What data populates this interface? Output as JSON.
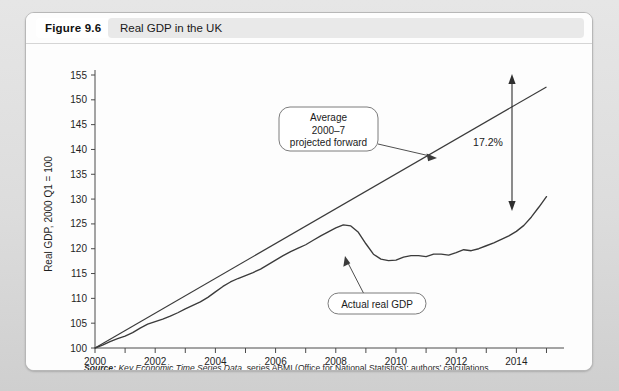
{
  "figure": {
    "number_label": "Figure 9.6",
    "title": "Real GDP in the UK",
    "source_lead": "Source:",
    "source_italic": " Key Economic Time Series Data,",
    "source_rest": " series ABMI (Office for National Statistics); authors’ calculations"
  },
  "annotations": {
    "trend_line1": "Average",
    "trend_line2": "2000–7",
    "trend_line3": "projected forward",
    "actual_label": "Actual real GDP",
    "gap_label": "17.2%"
  },
  "chart_data": {
    "type": "line",
    "title": "Real GDP in the UK",
    "xlabel": "",
    "ylabel": "Real GDP, 2000 Q1 = 100",
    "xlim": [
      2000,
      2015.25
    ],
    "ylim": [
      100,
      155
    ],
    "ytick_step": 5,
    "yticks": [
      100,
      105,
      110,
      115,
      120,
      125,
      130,
      135,
      140,
      145,
      150,
      155
    ],
    "xticks_major": [
      2000,
      2002,
      2004,
      2006,
      2008,
      2010,
      2012,
      2014
    ],
    "xticks_minor": [
      2001,
      2003,
      2005,
      2007,
      2009,
      2011,
      2013,
      2015
    ],
    "grid": false,
    "legend": "none",
    "series": [
      {
        "name": "Actual real GDP",
        "x": [
          2000.0,
          2000.25,
          2000.5,
          2000.75,
          2001.0,
          2001.25,
          2001.5,
          2001.75,
          2002.0,
          2002.25,
          2002.5,
          2002.75,
          2003.0,
          2003.25,
          2003.5,
          2003.75,
          2004.0,
          2004.25,
          2004.5,
          2004.75,
          2005.0,
          2005.25,
          2005.5,
          2005.75,
          2006.0,
          2006.25,
          2006.5,
          2006.75,
          2007.0,
          2007.25,
          2007.5,
          2007.75,
          2008.0,
          2008.25,
          2008.5,
          2008.75,
          2009.0,
          2009.25,
          2009.5,
          2009.75,
          2010.0,
          2010.25,
          2010.5,
          2010.75,
          2011.0,
          2011.25,
          2011.5,
          2011.75,
          2012.0,
          2012.25,
          2012.5,
          2012.75,
          2013.0,
          2013.25,
          2013.5,
          2013.75,
          2014.0,
          2014.25,
          2014.5,
          2014.75,
          2015.0
        ],
        "values": [
          100.0,
          100.6,
          101.3,
          101.9,
          102.4,
          103.1,
          104.0,
          104.8,
          105.3,
          105.8,
          106.4,
          107.1,
          107.9,
          108.6,
          109.3,
          110.2,
          111.3,
          112.4,
          113.3,
          114.0,
          114.6,
          115.2,
          115.9,
          116.8,
          117.7,
          118.6,
          119.4,
          120.1,
          120.8,
          121.7,
          122.6,
          123.4,
          124.2,
          124.8,
          124.6,
          123.3,
          121.0,
          118.9,
          117.9,
          117.6,
          117.7,
          118.3,
          118.6,
          118.6,
          118.4,
          118.9,
          118.9,
          118.7,
          119.2,
          119.8,
          119.6,
          120.0,
          120.6,
          121.2,
          121.9,
          122.6,
          123.5,
          124.7,
          126.4,
          128.4,
          130.5
        ]
      },
      {
        "name": "Average 2000–7 projected forward",
        "x": [
          2000.0,
          2015.0
        ],
        "values": [
          100.0,
          152.6
        ]
      }
    ]
  }
}
